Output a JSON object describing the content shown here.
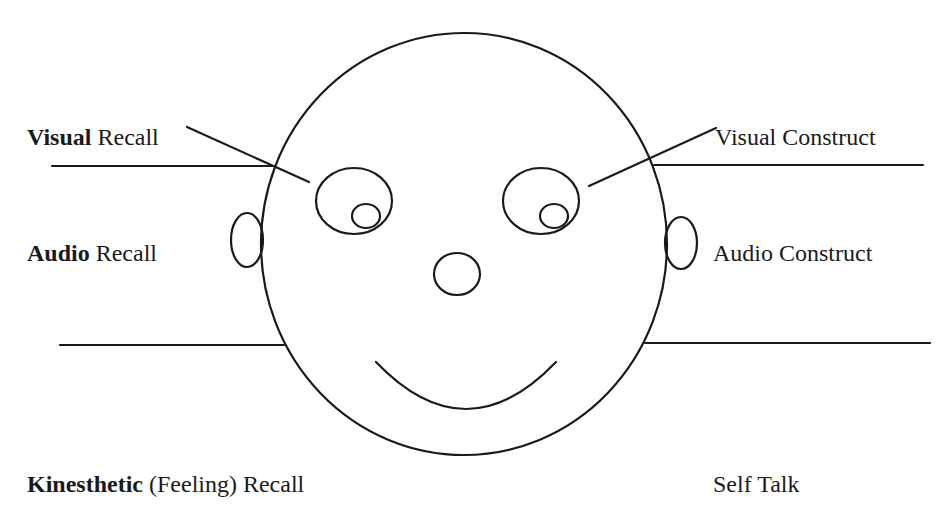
{
  "diagram": {
    "type": "eye-accessing-cues",
    "colors": {
      "stroke": "#1a1a1a",
      "text": "#1a1a1a",
      "background": "#ffffff"
    },
    "labels": {
      "visual_recall": {
        "bold": "Visual",
        "rest": " Recall"
      },
      "visual_construct": {
        "bold": "",
        "rest": "Visual Construct"
      },
      "audio_recall": {
        "bold": "Audio",
        "rest": " Recall"
      },
      "audio_construct": {
        "bold": "",
        "rest": "Audio Construct"
      },
      "kinesthetic_recall": {
        "bold": "Kinesthetic",
        "rest": " (Feeling) Recall"
      },
      "self_talk": {
        "bold": "",
        "rest": "Self Talk"
      }
    },
    "shapes": {
      "head": {
        "cx": 464,
        "cy": 244,
        "rx": 203,
        "ry": 211
      },
      "left_eye": {
        "cx": 354,
        "cy": 201,
        "rx": 38,
        "ry": 33
      },
      "left_pupil": {
        "cx": 366,
        "cy": 216,
        "rx": 14,
        "ry": 12
      },
      "right_eye": {
        "cx": 541,
        "cy": 201,
        "rx": 38,
        "ry": 33
      },
      "right_pupil": {
        "cx": 554,
        "cy": 216,
        "rx": 14,
        "ry": 12
      },
      "nose": {
        "cx": 457,
        "cy": 274,
        "rx": 23,
        "ry": 21
      },
      "left_ear": {
        "cx": 247,
        "cy": 240,
        "rx": 16,
        "ry": 27
      },
      "right_ear": {
        "cx": 681,
        "cy": 243,
        "rx": 16,
        "ry": 26
      },
      "mouth": {
        "x1": 376,
        "y1": 362,
        "cx": 466,
        "cy": 456,
        "x2": 556,
        "y2": 362
      }
    },
    "lines": {
      "left_upper": {
        "x1": 52,
        "y1": 166,
        "x2": 275,
        "y2": 166
      },
      "left_lower": {
        "x1": 60,
        "y1": 345,
        "x2": 284,
        "y2": 345
      },
      "right_upper": {
        "x1": 654,
        "y1": 165,
        "x2": 923,
        "y2": 165
      },
      "right_lower": {
        "x1": 645,
        "y1": 343,
        "x2": 930,
        "y2": 343
      },
      "left_pointer": {
        "x1": 187,
        "y1": 127,
        "x2": 309,
        "y2": 182
      },
      "right_pointer": {
        "x1": 589,
        "y1": 186,
        "x2": 716,
        "y2": 128
      }
    }
  }
}
